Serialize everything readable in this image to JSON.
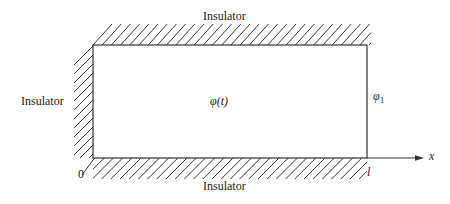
{
  "diagram": {
    "labels": {
      "top": "Insulator",
      "left": "Insulator",
      "bottom": "Insulator",
      "center": "φ(t)",
      "right_main": "φ",
      "right_sub": "1",
      "origin": "0",
      "length": "l",
      "axis": "x"
    },
    "colors": {
      "stroke": "#333333",
      "text": "#1a1a1a",
      "background": "#ffffff"
    }
  }
}
